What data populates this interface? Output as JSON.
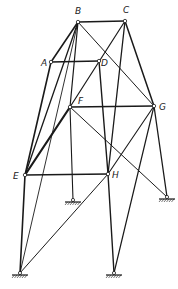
{
  "diagram": {
    "type": "space-truss",
    "line_color": "#1a1a1a",
    "background": "#ffffff",
    "nodes": [
      {
        "id": "A",
        "label": "A",
        "x": 51,
        "y": 62,
        "lx": 41,
        "ly": 66
      },
      {
        "id": "B",
        "label": "B",
        "x": 78,
        "y": 22,
        "lx": 75,
        "ly": 14
      },
      {
        "id": "C",
        "label": "C",
        "x": 125,
        "y": 21,
        "lx": 123,
        "ly": 13
      },
      {
        "id": "D",
        "label": "D",
        "x": 99,
        "y": 61,
        "lx": 101,
        "ly": 66
      },
      {
        "id": "E",
        "label": "E",
        "x": 25,
        "y": 175,
        "lx": 13,
        "ly": 179
      },
      {
        "id": "F",
        "label": "F",
        "x": 70,
        "y": 107,
        "lx": 78,
        "ly": 104
      },
      {
        "id": "G",
        "label": "G",
        "x": 154,
        "y": 106,
        "lx": 159,
        "ly": 110
      },
      {
        "id": "H",
        "label": "H",
        "x": 108,
        "y": 174,
        "lx": 112,
        "ly": 178
      }
    ],
    "supports": [
      {
        "id": "S1",
        "x": 73,
        "y": 200
      },
      {
        "id": "S2",
        "x": 167,
        "y": 197
      },
      {
        "id": "S3",
        "x": 20,
        "y": 273
      },
      {
        "id": "S4",
        "x": 114,
        "y": 273
      }
    ],
    "members": [
      {
        "from": "B",
        "to": "C",
        "w": 1.6
      },
      {
        "from": "A",
        "to": "D",
        "w": 1.4
      },
      {
        "from": "B",
        "to": "A",
        "w": 1.6
      },
      {
        "from": "B",
        "to": "E",
        "w": 1.3
      },
      {
        "from": "B",
        "to": "F",
        "w": 1.2
      },
      {
        "from": "B",
        "to": "S3",
        "w": 0.9
      },
      {
        "from": "B",
        "to": "G",
        "w": 1.0
      },
      {
        "from": "C",
        "to": "F",
        "w": 1.2
      },
      {
        "from": "C",
        "to": "H",
        "w": 1.3
      },
      {
        "from": "C",
        "to": "G",
        "w": 1.5
      },
      {
        "from": "D",
        "to": "H",
        "w": 1.4
      },
      {
        "from": "A",
        "to": "E",
        "w": 1.6
      },
      {
        "from": "F",
        "to": "E",
        "w": 2.2
      },
      {
        "from": "F",
        "to": "G",
        "w": 1.3
      },
      {
        "from": "F",
        "to": "S1",
        "w": 1.1
      },
      {
        "from": "F",
        "to": "S2",
        "w": 1.0
      },
      {
        "from": "E",
        "to": "H",
        "w": 1.6
      },
      {
        "from": "E",
        "to": "S3",
        "w": 1.6
      },
      {
        "from": "G",
        "to": "H",
        "w": 1.1
      },
      {
        "from": "G",
        "to": "S2",
        "w": 1.3
      },
      {
        "from": "G",
        "to": "S4",
        "w": 1.2
      },
      {
        "from": "H",
        "to": "S3",
        "w": 1.0
      },
      {
        "from": "H",
        "to": "S4",
        "w": 1.4
      }
    ]
  }
}
